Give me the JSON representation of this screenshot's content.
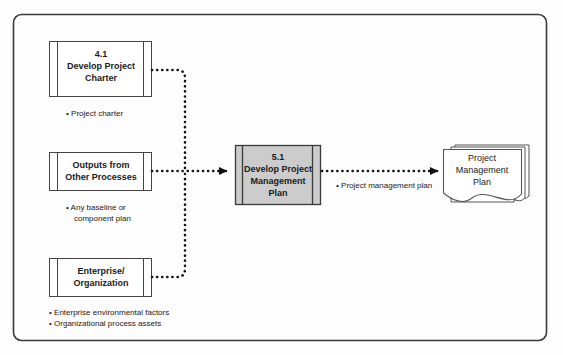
{
  "diagram": {
    "frame": {
      "border_color": "#3a3a3a",
      "fill": "#fdfdfd"
    },
    "colors": {
      "process_fill": "#cccccc",
      "box_fill": "#ffffff",
      "line": "#111111",
      "text": "#1a1a1a"
    },
    "inputs": [
      {
        "id": "develop-project-charter",
        "number": "4.1",
        "line1": "Develop Project",
        "line2": "Charter",
        "outputs": [
          "Project charter"
        ]
      },
      {
        "id": "outputs-from-other-processes",
        "number": "",
        "line1": "Outputs from",
        "line2": "Other Processes",
        "outputs": [
          "Any baseline or",
          "component plan"
        ]
      },
      {
        "id": "enterprise-organization",
        "number": "",
        "line1": "Enterprise/",
        "line2": "Organization",
        "outputs": [
          "Enterprise environmental factors",
          "Organizational process assets"
        ]
      }
    ],
    "process": {
      "id": "develop-project-management-plan",
      "number": "5.1",
      "line1": "Develop Project",
      "line2": "Management",
      "line3": "Plan"
    },
    "flow_label": "Project management plan",
    "document": {
      "id": "project-management-plan-document",
      "line1": "Project",
      "line2": "Management",
      "line3": "Plan"
    },
    "bullet_glyph": "•"
  }
}
